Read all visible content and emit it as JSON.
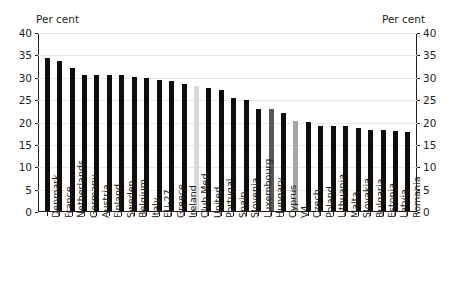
{
  "axes": {
    "left_unit_label": "Per cent",
    "right_unit_label": "Per cent",
    "ytick_labels": [
      "40",
      "35",
      "30",
      "25",
      "20",
      "15",
      "10",
      "5",
      "0"
    ]
  },
  "colors": {
    "bar_default": "#0d0d0d",
    "bar_light_gray": "#d9d9d9",
    "bar_medium_gray": "#a6a6a6",
    "bar_dark_gray": "#595959",
    "axis": "#231f20",
    "gridline": "#e8e8e8",
    "background": "#ffffff"
  },
  "chart_data": {
    "type": "bar",
    "title": "",
    "subtitle": "",
    "xlabel": "",
    "ylabel": "Per cent",
    "ylim": [
      0,
      40
    ],
    "ytick_step": 5,
    "grid": true,
    "legend": "none",
    "orientation": "vertical",
    "sorted": "descending",
    "categories": [
      "Denmark",
      "France",
      "Netherlands",
      "Germany",
      "Austria",
      "Finland",
      "Sweden",
      "Belgium",
      "Italy",
      "EU-27",
      "Greece",
      "Ireland",
      "Club Med",
      "United",
      "Portugal",
      "Spain",
      "Slovenia",
      "Luxembourg",
      "Hungary",
      "Cyprus",
      "V4",
      "Czech",
      "Poland",
      "Lithuania",
      "Malta",
      "Slovakia",
      "Bulgaria",
      "Estonia",
      "Latvia",
      "Romania"
    ],
    "values": [
      34.4,
      33.8,
      32.2,
      30.6,
      30.6,
      30.6,
      30.6,
      30.2,
      30.0,
      29.5,
      29.2,
      28.6,
      28.0,
      27.6,
      27.1,
      25.3,
      24.9,
      23.0,
      23.0,
      22.1,
      20.2,
      20.1,
      19.2,
      19.2,
      19.2,
      18.7,
      18.2,
      18.2,
      18.0,
      17.7
    ],
    "bar_colors": [
      "#0d0d0d",
      "#0d0d0d",
      "#0d0d0d",
      "#0d0d0d",
      "#0d0d0d",
      "#0d0d0d",
      "#0d0d0d",
      "#0d0d0d",
      "#0d0d0d",
      "#0d0d0d",
      "#0d0d0d",
      "#0d0d0d",
      "#d9d9d9",
      "#0d0d0d",
      "#0d0d0d",
      "#0d0d0d",
      "#0d0d0d",
      "#0d0d0d",
      "#595959",
      "#0d0d0d",
      "#a6a6a6",
      "#0d0d0d",
      "#0d0d0d",
      "#0d0d0d",
      "#0d0d0d",
      "#0d0d0d",
      "#0d0d0d",
      "#0d0d0d",
      "#0d0d0d",
      "#0d0d0d"
    ],
    "highlighted": [
      {
        "category": "Club Med",
        "value": 28.0,
        "color": "#d9d9d9"
      },
      {
        "category": "Hungary",
        "value": 23.0,
        "color": "#595959"
      },
      {
        "category": "V4",
        "value": 20.2,
        "color": "#a6a6a6"
      }
    ]
  }
}
